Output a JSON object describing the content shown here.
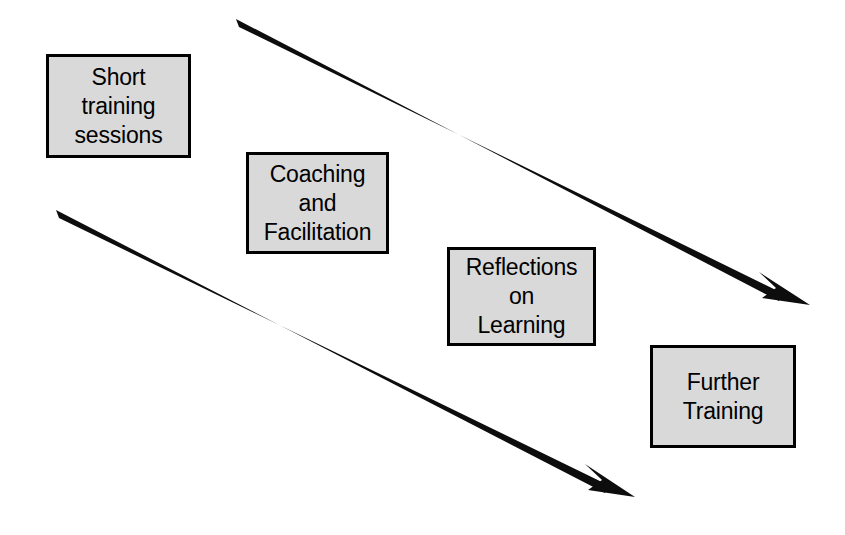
{
  "diagram": {
    "type": "flow-progression",
    "canvas": {
      "width": 845,
      "height": 535
    },
    "background_color": "#ffffff",
    "box_fill_color": "#d9d9d9",
    "box_border_color": "#000000",
    "text_color": "#000000",
    "arrow_color": "#000000",
    "boxes": [
      {
        "id": "short-training-sessions",
        "lines": [
          "Short",
          "training",
          "sessions"
        ],
        "x": 46,
        "y": 54,
        "width": 145,
        "height": 104
      },
      {
        "id": "coaching-and-facilitation",
        "lines": [
          "Coaching",
          "and",
          "Facilitation"
        ],
        "x": 246,
        "y": 152,
        "width": 143,
        "height": 102
      },
      {
        "id": "reflections-on-learning",
        "lines": [
          "Reflections",
          "on",
          "Learning"
        ],
        "x": 447,
        "y": 247,
        "width": 149,
        "height": 99
      },
      {
        "id": "further-training",
        "lines": [
          "Further",
          "Training"
        ],
        "x": 650,
        "y": 345,
        "width": 146,
        "height": 103
      }
    ],
    "arrows": [
      {
        "id": "upper-arrow",
        "from": {
          "x": 236,
          "y": 23
        },
        "to": {
          "x": 810,
          "y": 305
        },
        "direction": "down-right"
      },
      {
        "id": "lower-arrow",
        "from": {
          "x": 56,
          "y": 214
        },
        "to": {
          "x": 635,
          "y": 497
        },
        "direction": "down-right"
      }
    ]
  }
}
